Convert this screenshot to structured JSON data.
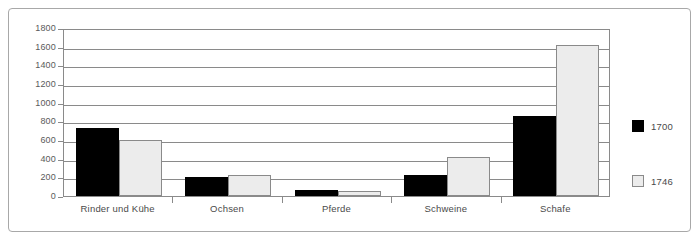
{
  "chart_data": {
    "type": "bar",
    "title": "",
    "xlabel": "",
    "ylabel": "",
    "categories": [
      "Rinder und Kühe",
      "Ochsen",
      "Pferde",
      "Schweine",
      "Schafe"
    ],
    "series": [
      {
        "name": "1700",
        "color": "#000000",
        "values": [
          730,
          200,
          60,
          220,
          860
        ]
      },
      {
        "name": "1746",
        "color": "#ececec",
        "values": [
          600,
          220,
          55,
          420,
          1620
        ]
      }
    ],
    "ylim": [
      0,
      1800
    ],
    "ytick_step": 200,
    "yticks": [
      "0",
      "200",
      "400",
      "600",
      "800",
      "1000",
      "1200",
      "1400",
      "1600",
      "1800"
    ],
    "grid": true,
    "legend_position": "right"
  },
  "legend": {
    "entries": [
      {
        "label": "1700",
        "swatch": "black-square-swatch"
      },
      {
        "label": "1746",
        "swatch": "light-gray-square-swatch"
      }
    ]
  },
  "axes": {
    "y_axis_name": "y-axis",
    "x_axis_name": "x-axis"
  }
}
